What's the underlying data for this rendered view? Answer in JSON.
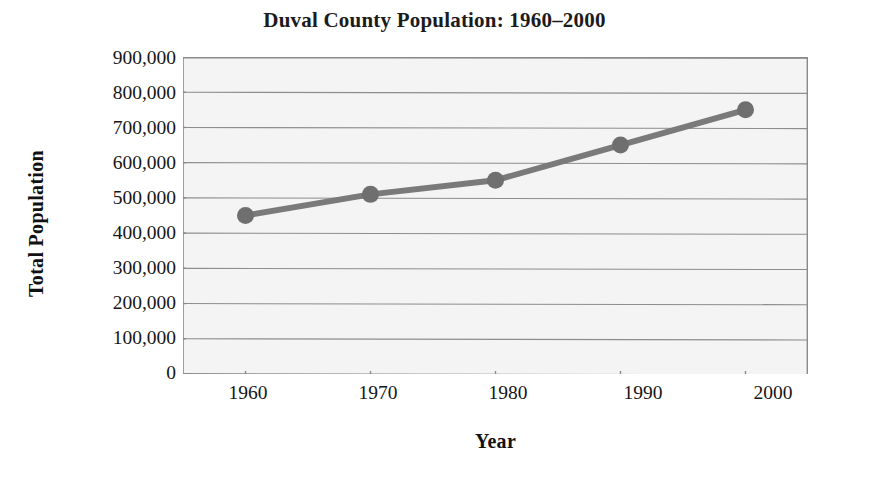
{
  "chart_data": {
    "type": "line",
    "title": "Duval County Population: 1960–2000",
    "xlabel": "Year",
    "ylabel": "Total Population",
    "categories": [
      "1960",
      "1970",
      "1980",
      "1990",
      "2000"
    ],
    "x": [
      1960,
      1970,
      1980,
      1990,
      2000
    ],
    "values": [
      450000,
      510000,
      550000,
      650000,
      750000
    ],
    "series": [
      {
        "name": "Total Population",
        "values": [
          450000,
          510000,
          550000,
          650000,
          750000
        ]
      }
    ],
    "ylim": [
      0,
      900000
    ],
    "xlim": [
      1955,
      2005
    ],
    "ytick_labels": [
      "900,000",
      "800,000",
      "700,000",
      "600,000",
      "500,000",
      "400,000",
      "300,000",
      "200,000",
      "100,000",
      "0"
    ],
    "ytick_values": [
      900000,
      800000,
      700000,
      600000,
      500000,
      400000,
      300000,
      200000,
      100000,
      0
    ],
    "xtick_labels": [
      "1960",
      "1970",
      "1980",
      "1990",
      "2000"
    ],
    "grid": "horizontal",
    "legend": "none",
    "colors": {
      "line": "#7a7a7a",
      "marker": "#6f6f6f",
      "plot_background": "#f4f4f4",
      "gridline": "#8d8d8d",
      "axis": "#8a8a8a",
      "text": "#151515"
    },
    "marker_style": "circle",
    "line_width": 6
  },
  "artifact": {
    "bleed_text": "faint reverse-side bleed-through from scanned page"
  }
}
